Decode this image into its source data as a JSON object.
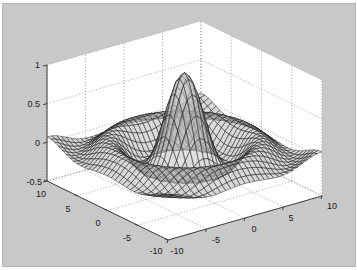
{
  "chart_data": {
    "type": "surface",
    "subtype": "mesh",
    "function": "z = sin(sqrt(x^2+y^2)) / sqrt(x^2+y^2)",
    "title": "",
    "xlabel": "",
    "ylabel": "",
    "zlabel": "",
    "x_range": [
      -10,
      10
    ],
    "y_range": [
      -10,
      10
    ],
    "zlim": [
      -0.5,
      1
    ],
    "grid": true,
    "grid_points": 33,
    "peak": {
      "x": 0,
      "y": 0,
      "z": 1
    },
    "x_ticks": [
      "-10",
      "-5",
      "0",
      "5",
      "10"
    ],
    "y_ticks": [
      "10",
      "5",
      "0",
      "-5",
      "-10"
    ],
    "z_ticks": [
      "1",
      "0.5",
      "0",
      "-0.5"
    ],
    "colors": {
      "figure_background": "#c8c8c8",
      "axes_background": "#ffffff",
      "mesh_edge": "#1e1e1e",
      "mesh_face_light": "#d8d8d8",
      "mesh_face_dark": "#6e6e6e",
      "grid_line": "#909090",
      "axis_line": "#404040"
    }
  }
}
